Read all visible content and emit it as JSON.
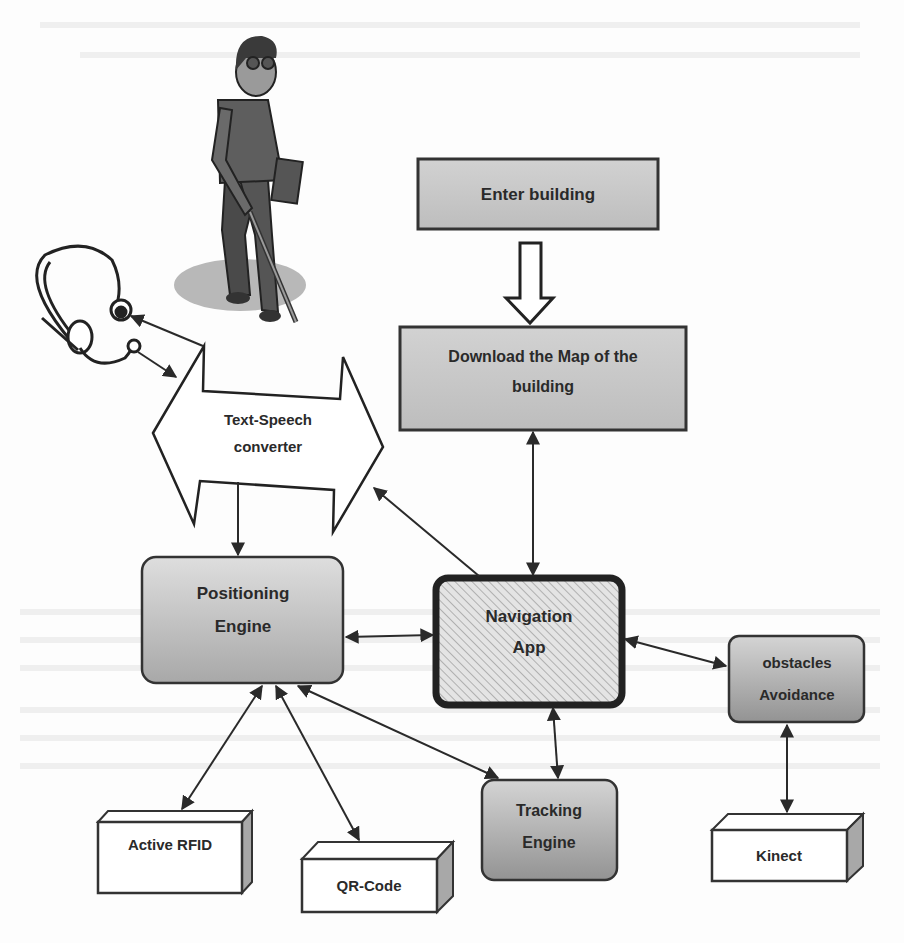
{
  "diagram": {
    "type": "system-architecture",
    "title": "",
    "colors": {
      "box_fill_light": "#d6d6d6",
      "box_fill_dark": "#9e9e9e",
      "border": "#333333",
      "text": "#2b2b2b",
      "shadow_ellipse": "#b5b5b5",
      "hatch": "#c8c8c8"
    },
    "illustrations": {
      "person": "blind person walking with white cane",
      "headset": "headset with microphone"
    },
    "nodes": {
      "enter_building": {
        "label": "Enter building"
      },
      "download_map": {
        "label_line1": "Download the Map of the",
        "label_line2": "building"
      },
      "text_speech": {
        "label_line1": "Text-Speech",
        "label_line2": "converter"
      },
      "positioning_engine": {
        "label_line1": "Positioning",
        "label_line2": "Engine"
      },
      "navigation_app": {
        "label_line1": "Navigation",
        "label_line2": "App"
      },
      "obstacles_avoidance": {
        "label_line1": "obstacles",
        "label_line2": "Avoidance"
      },
      "tracking_engine": {
        "label_line1": "Tracking",
        "label_line2": "Engine"
      },
      "active_rfid": {
        "label": "Active RFID"
      },
      "qr_code": {
        "label": "QR-Code"
      },
      "kinect": {
        "label": "Kinect"
      }
    },
    "edges": [
      {
        "from": "Enter building",
        "to": "Download the Map of the building",
        "style": "hollow-block-arrow"
      },
      {
        "from": "Download the Map of the building",
        "to": "Navigation App",
        "style": "bidirectional"
      },
      {
        "from": "Navigation App",
        "to": "Text-Speech converter",
        "style": "directed"
      },
      {
        "from": "Text-Speech converter",
        "to": "Positioning Engine",
        "style": "directed"
      },
      {
        "from": "Text-Speech converter",
        "to": "Headset speaker",
        "style": "directed"
      },
      {
        "from": "Headset microphone",
        "to": "Text-Speech converter",
        "style": "directed"
      },
      {
        "from": "Positioning Engine",
        "to": "Navigation App",
        "style": "bidirectional"
      },
      {
        "from": "Navigation App",
        "to": "obstacles Avoidance",
        "style": "bidirectional"
      },
      {
        "from": "Navigation App",
        "to": "Tracking Engine",
        "style": "bidirectional"
      },
      {
        "from": "Positioning Engine",
        "to": "Tracking Engine",
        "style": "bidirectional"
      },
      {
        "from": "Positioning Engine",
        "to": "Active RFID",
        "style": "bidirectional"
      },
      {
        "from": "Positioning Engine",
        "to": "QR-Code",
        "style": "bidirectional"
      },
      {
        "from": "obstacles Avoidance",
        "to": "Kinect",
        "style": "bidirectional"
      }
    ]
  }
}
